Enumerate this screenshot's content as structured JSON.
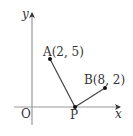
{
  "diagram": {
    "type": "coordinate-plane",
    "axes": {
      "x_label": "x",
      "y_label": "y",
      "origin_label": "O"
    },
    "points": {
      "A": {
        "label": "A(2, 5)",
        "name": "A",
        "coords": [
          2,
          5
        ]
      },
      "B": {
        "label": "B(8, 2)",
        "name": "B",
        "coords": [
          8,
          2
        ]
      },
      "P": {
        "label": "P",
        "name": "P",
        "on": "x-axis"
      }
    },
    "segments": [
      {
        "from": "A",
        "to": "P"
      },
      {
        "from": "P",
        "to": "B"
      }
    ],
    "colors": {
      "axis": "#999999",
      "segment": "#444444",
      "point": "#111111",
      "text": "#333333"
    }
  }
}
